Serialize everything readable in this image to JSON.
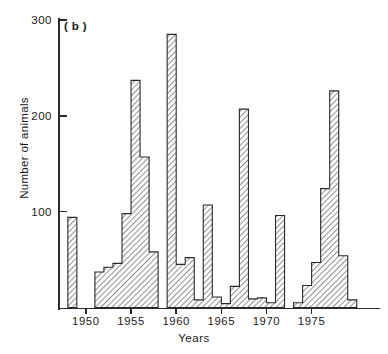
{
  "panel": {
    "label": "( b )"
  },
  "axes": {
    "y_title": "Number of animals",
    "x_title": "Years",
    "y_ticks": [
      100,
      200,
      300
    ],
    "y_tick_labels": [
      "100",
      "200",
      "300"
    ],
    "x_ticks": [
      1950,
      1955,
      1960,
      1965,
      1970,
      1975
    ],
    "x_tick_labels": [
      "1950",
      "1955",
      "1960",
      "1965",
      "1970",
      "1975"
    ],
    "y_min": 0,
    "y_max": 300,
    "x_min": 1947,
    "x_max": 1980
  },
  "style": {
    "axis_color": "#2a2a2a",
    "bar_edge_color": "#2a2a2a",
    "bar_fill": "#ffffff",
    "hatch": "diagonal-forward-slash"
  },
  "chart_data": {
    "type": "bar",
    "title": "",
    "subtitle": "",
    "xlabel": "Years",
    "ylabel": "Number of animals",
    "xlim": [
      1947,
      1980
    ],
    "ylim": [
      0,
      300
    ],
    "grid": false,
    "legend": null,
    "annotations": [
      "( b )"
    ],
    "categories": [
      1948,
      1949,
      1950,
      1951,
      1952,
      1953,
      1954,
      1955,
      1956,
      1957,
      1958,
      1959,
      1960,
      1961,
      1962,
      1963,
      1964,
      1965,
      1966,
      1967,
      1968,
      1969,
      1970,
      1971,
      1972,
      1973,
      1974,
      1975,
      1976,
      1977,
      1978,
      1979
    ],
    "values": [
      94,
      0,
      0,
      37,
      42,
      46,
      98,
      237,
      157,
      58,
      0,
      285,
      45,
      52,
      8,
      107,
      11,
      4,
      22,
      207,
      9,
      10,
      5,
      96,
      0,
      5,
      23,
      47,
      124,
      226,
      54,
      8
    ]
  }
}
